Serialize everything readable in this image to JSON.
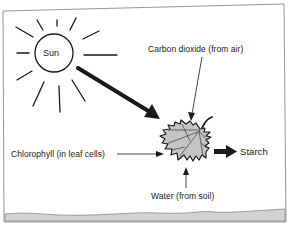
{
  "diagram": {
    "labels": {
      "sun": "Sun",
      "carbon_dioxide": "Carbon dioxide (from air)",
      "chlorophyll": "Chlorophyll (in leaf cells)",
      "starch": "Starch",
      "water": "Water (from soil)"
    },
    "nodes": [
      {
        "id": "sun",
        "label": "Sun",
        "shape": "circle-with-rays"
      },
      {
        "id": "leaf",
        "label": "",
        "shape": "maple-leaf"
      },
      {
        "id": "carbon_dioxide",
        "label": "Carbon dioxide (from air)"
      },
      {
        "id": "chlorophyll",
        "label": "Chlorophyll (in leaf cells)"
      },
      {
        "id": "water",
        "label": "Water (from soil)"
      },
      {
        "id": "starch",
        "label": "Starch"
      }
    ],
    "edges": [
      {
        "from": "sun",
        "to": "leaf",
        "style": "thick-arrow"
      },
      {
        "from": "carbon_dioxide",
        "to": "leaf",
        "style": "thin-arrow"
      },
      {
        "from": "chlorophyll",
        "to": "leaf",
        "style": "thin-arrow"
      },
      {
        "from": "water",
        "to": "leaf",
        "style": "thin-arrow"
      },
      {
        "from": "leaf",
        "to": "starch",
        "style": "thick-arrow"
      }
    ],
    "colors": {
      "ink": "#1a1a1a",
      "leaf_fill": "#c4c4c4",
      "ground_fill": "#d2d2d2",
      "frame": "#8a8a8a"
    }
  }
}
